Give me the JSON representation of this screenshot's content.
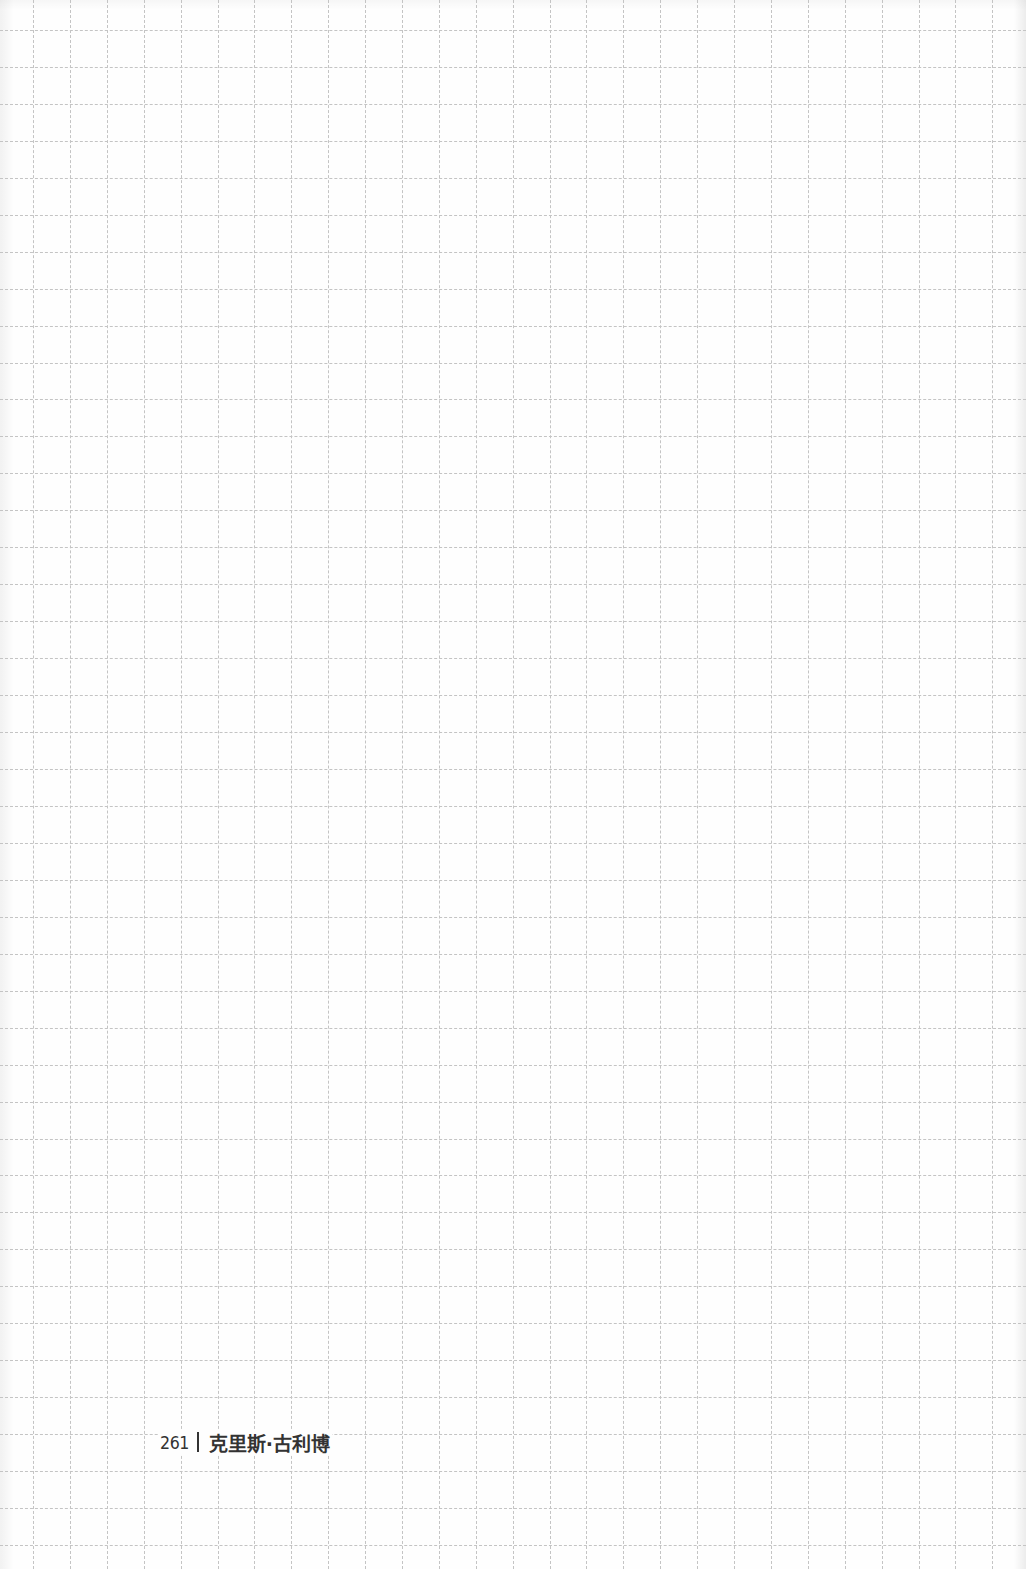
{
  "page": {
    "background_color": "#fefefe",
    "grid": {
      "style": "dashed",
      "line_color": "#c4c4c4",
      "cell_size_px": 37
    }
  },
  "footer": {
    "page_number": "261",
    "separator": "|",
    "author": "克里斯·古利博",
    "text_color": "#333333"
  }
}
